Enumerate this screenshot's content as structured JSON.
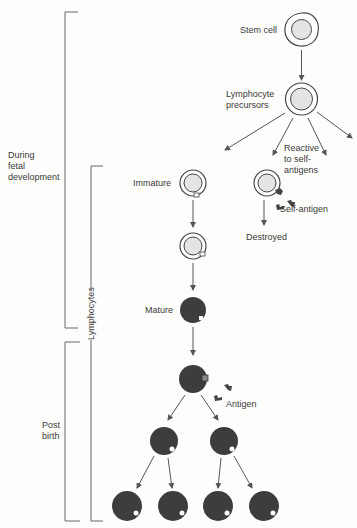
{
  "brackets": {
    "fetal": "During\nfetal\ndevelopment",
    "lymphocytes": "Lymphocytes",
    "post_birth": "Post\nbirth"
  },
  "labels": {
    "stem_cell": "Stem cell",
    "lymphocyte_precursors": "Lymphocyte\nprecursors",
    "reactive": "Reactive\nto self-\nantigens",
    "self_antigen": "Self-antigen",
    "destroyed": "Destroyed",
    "immature": "Immature",
    "mature": "Mature",
    "antigen": "Antigen"
  },
  "colors": {
    "line": "#555555",
    "immature_fill": "#e4e4e2",
    "mature_fill": "#3d3d3d",
    "background": "#fdfdfb"
  }
}
